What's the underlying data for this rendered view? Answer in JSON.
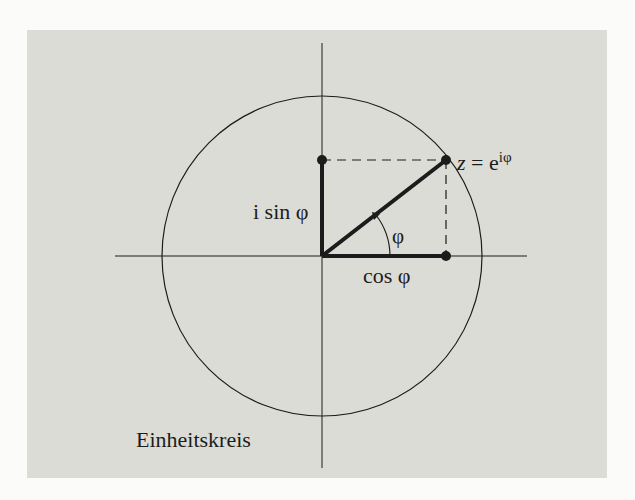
{
  "figure": {
    "caption": "Einheitskreis",
    "labels": {
      "point": "z = e",
      "point_exponent": "iφ",
      "imaginary_part": "i sin φ",
      "real_part": "cos φ",
      "angle": "φ"
    },
    "colors": {
      "background": "#fbfbf9",
      "panel": "#dcdcd7",
      "ink": "#1c1c1c"
    },
    "geometry": {
      "origin": [
        322,
        256
      ],
      "radius": 160,
      "angle_deg": 37.7,
      "point_z": [
        446,
        160
      ],
      "point_sin": [
        322,
        160
      ],
      "point_cos": [
        446,
        256
      ]
    }
  }
}
